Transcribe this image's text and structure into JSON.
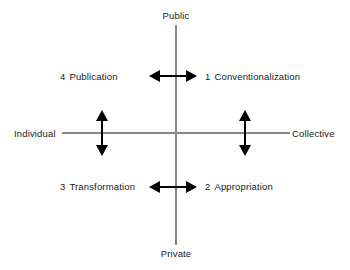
{
  "diagram": {
    "title": "",
    "axes": {
      "vertical": {
        "top_label": "Public",
        "bottom_label": "Private",
        "color": "#858585"
      },
      "horizontal": {
        "left_label": "Individual",
        "right_label": "Collective",
        "color": "#858585"
      }
    },
    "quadrants": [
      {
        "number": "1",
        "label": "Conventionalization",
        "position": "top-right"
      },
      {
        "number": "2",
        "label": "Appropriation",
        "position": "bottom-right"
      },
      {
        "number": "3",
        "label": "Transformation",
        "position": "bottom-left"
      },
      {
        "number": "4",
        "label": "Publication",
        "position": "top-left"
      }
    ],
    "arrows": [
      {
        "name": "top-horizontal-double-arrow",
        "orientation": "horizontal",
        "color": "#000000"
      },
      {
        "name": "bottom-horizontal-double-arrow",
        "orientation": "horizontal",
        "color": "#000000"
      },
      {
        "name": "left-vertical-double-arrow",
        "orientation": "vertical",
        "color": "#000000"
      },
      {
        "name": "right-vertical-double-arrow",
        "orientation": "vertical",
        "color": "#000000"
      }
    ],
    "colors": {
      "background": "#ffffff",
      "text": "#1a1a1a",
      "axis": "#858585",
      "arrow": "#000000"
    }
  }
}
